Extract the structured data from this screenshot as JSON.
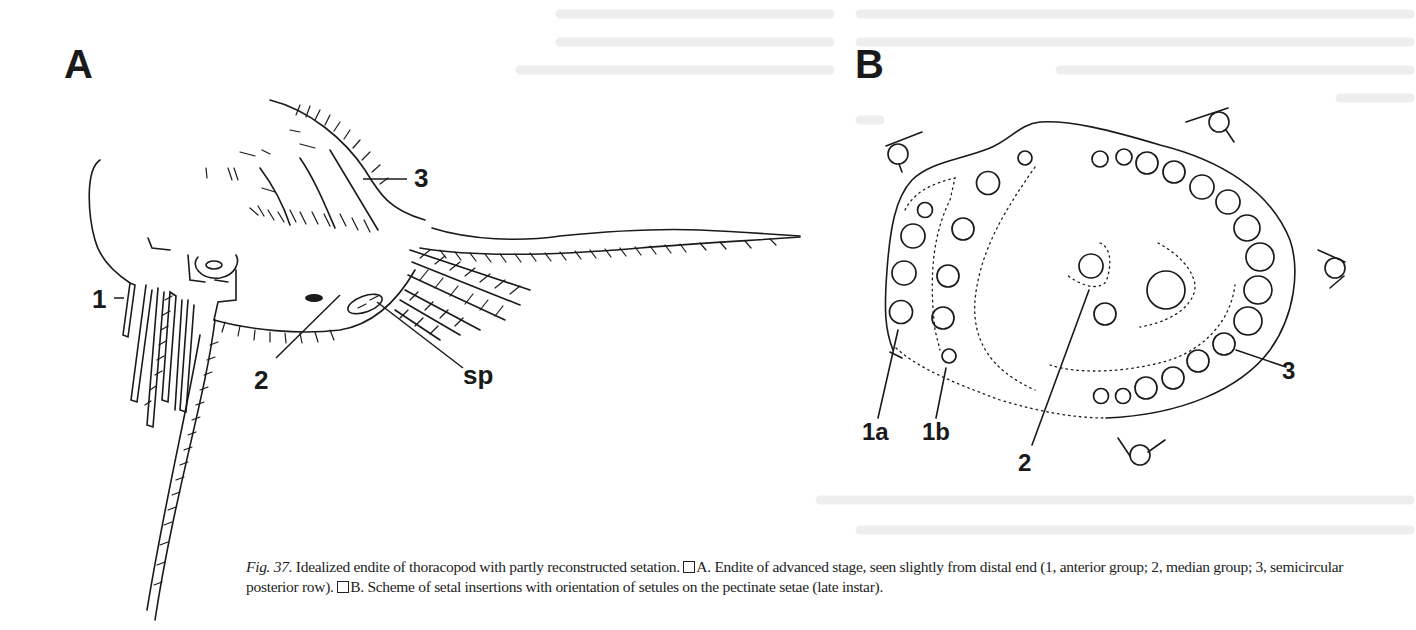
{
  "figure": {
    "number_label": "Fig. 37.",
    "panels": [
      {
        "letter": "A",
        "labels": [
          "1",
          "3",
          "2",
          "sp"
        ]
      },
      {
        "letter": "B",
        "labels": [
          "1a",
          "1b",
          "2",
          "3"
        ]
      }
    ],
    "caption": {
      "title": "Idealized endite of thoracopod with partly reconstructed setation.",
      "part_a_marker": "A.",
      "part_a_text": "Endite of advanced stage, seen slightly from distal end (1, anterior group; 2, median group; 3, semicircular posterior row).",
      "part_b_marker": "B.",
      "part_b_text": "Scheme of setal insertions with orientation of setules on the pectinate setae (late instar)."
    }
  },
  "colors": {
    "ink": "#1a1a1a",
    "paper": "#ffffff",
    "bleed_through": "#ececec"
  }
}
